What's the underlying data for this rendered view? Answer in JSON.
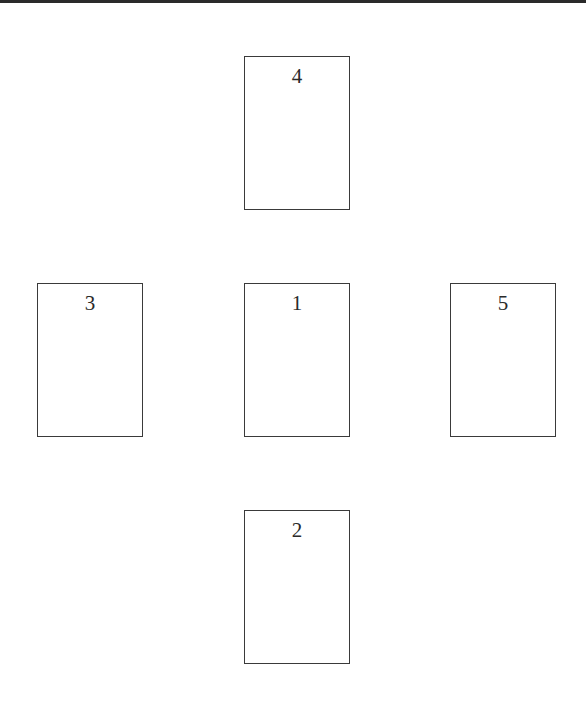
{
  "diagram": {
    "type": "card-spread",
    "layout": "cross",
    "cards": [
      {
        "label": "1",
        "position": "center",
        "x": 244,
        "y": 283,
        "w": 106,
        "h": 154
      },
      {
        "label": "2",
        "position": "bottom",
        "x": 244,
        "y": 510,
        "w": 106,
        "h": 154
      },
      {
        "label": "3",
        "position": "left",
        "x": 37,
        "y": 283,
        "w": 106,
        "h": 154
      },
      {
        "label": "4",
        "position": "top",
        "x": 244,
        "y": 56,
        "w": 106,
        "h": 154
      },
      {
        "label": "5",
        "position": "right",
        "x": 450,
        "y": 283,
        "w": 106,
        "h": 154
      }
    ],
    "colors": {
      "background": "#ffffff",
      "card_border": "#3a3a3a",
      "text": "#2a2a2a",
      "top_bar": "#2a2a2a"
    }
  }
}
